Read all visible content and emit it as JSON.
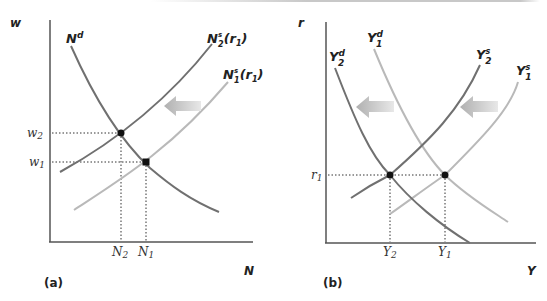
{
  "panels": [
    {
      "id": "a",
      "label": "(a)",
      "y_axis": "w",
      "x_axis": "N",
      "curves": {
        "demand": {
          "name": "N",
          "sup": "d",
          "color": "#6e6e6e"
        },
        "supply_2": {
          "name": "N",
          "sup": "s",
          "sub": "2",
          "arg": "(r",
          "argsub": "1",
          "argclose": ")",
          "color": "#7a7a7a"
        },
        "supply_1": {
          "name": "N",
          "sup": "s",
          "sub": "1",
          "arg": "(r",
          "argsub": "1",
          "argclose": ")",
          "color": "#b8b8b8"
        }
      },
      "tick_labels": {
        "w2": {
          "base": "w",
          "sub": "2"
        },
        "w1": {
          "base": "w",
          "sub": "1"
        },
        "N2": {
          "base": "N",
          "sub": "2"
        },
        "N1": {
          "base": "N",
          "sub": "1"
        }
      },
      "shift_arrow": "left"
    },
    {
      "id": "b",
      "label": "(b)",
      "y_axis": "r",
      "x_axis": "Y",
      "curves": {
        "demand_2": {
          "name": "Y",
          "sup": "d",
          "sub": "2",
          "color": "#6e6e6e"
        },
        "demand_1": {
          "name": "Y",
          "sup": "d",
          "sub": "1",
          "color": "#b8b8b8"
        },
        "supply_2": {
          "name": "Y",
          "sup": "s",
          "sub": "2",
          "color": "#7a7a7a"
        },
        "supply_1": {
          "name": "Y",
          "sup": "s",
          "sub": "1",
          "color": "#b8b8b8"
        }
      },
      "tick_labels": {
        "r1": {
          "base": "r",
          "sub": "1"
        },
        "Y2": {
          "base": "Y",
          "sub": "2"
        },
        "Y1": {
          "base": "Y",
          "sub": "1"
        }
      },
      "shift_arrows": [
        "left",
        "left"
      ]
    }
  ],
  "colors": {
    "axis": "#555555",
    "dark_curve": "#707070",
    "light_curve": "#b9b9b9",
    "arrow": "#c4c4c4",
    "point": "#111111"
  }
}
